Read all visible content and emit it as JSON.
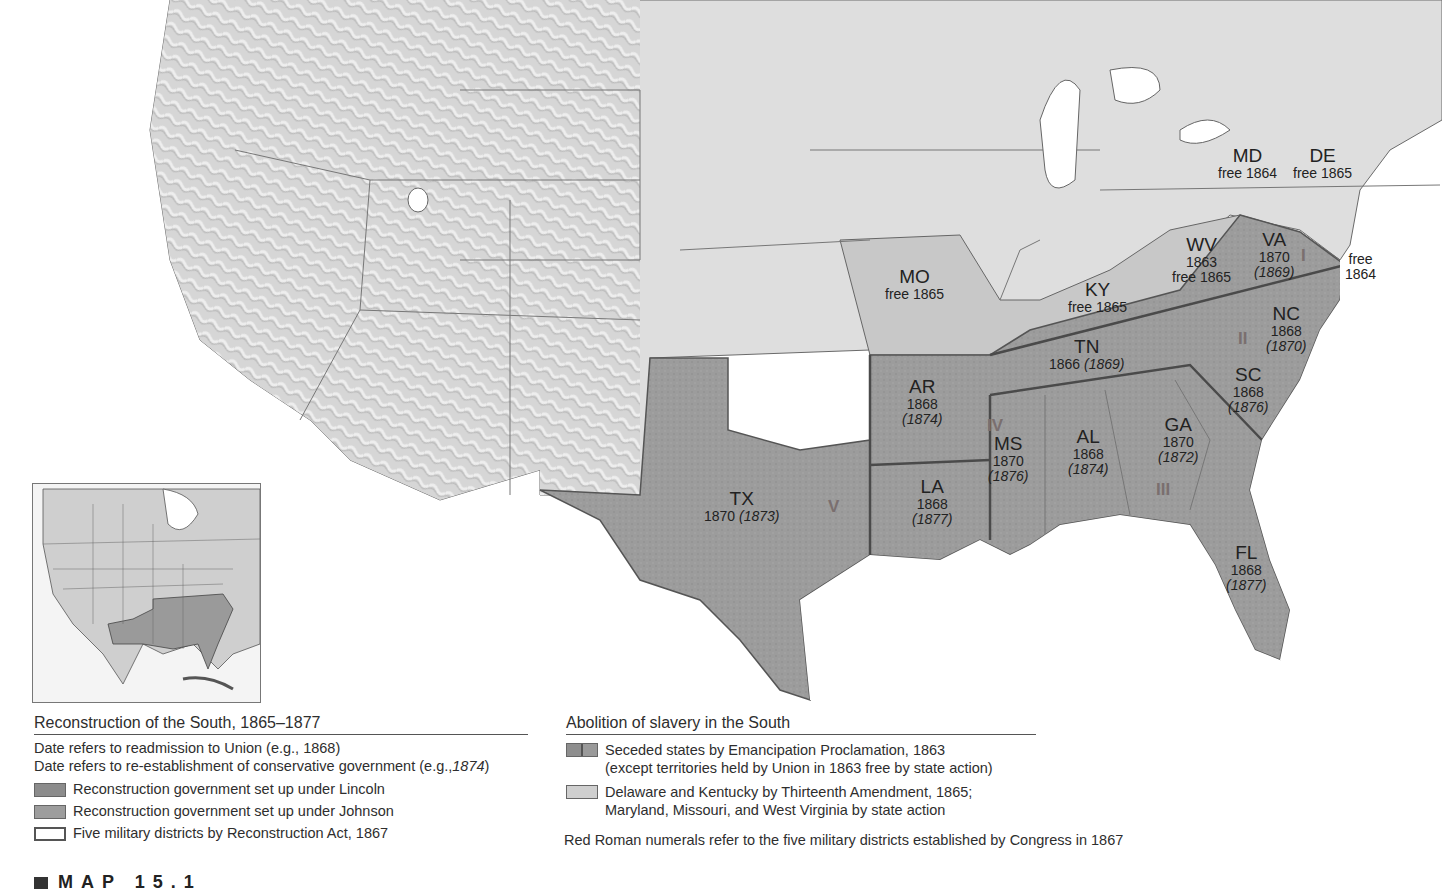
{
  "map": {
    "colors": {
      "union": "#dcdcdc",
      "west_relief": "#d4d4d4",
      "confederate": "#9a9a9a",
      "border_states": "#c6c6c6",
      "water": "#ffffff",
      "roman_numerals": "#7a6f6f"
    },
    "states": [
      {
        "abbr": "MD",
        "line1": "free 1864",
        "line2": ""
      },
      {
        "abbr": "DE",
        "line1": "free 1865",
        "line2": ""
      },
      {
        "abbr": "WV",
        "line1": "1863",
        "line2": "free 1865"
      },
      {
        "abbr": "VA",
        "line1": "1870",
        "line2": "(1869)"
      },
      {
        "abbr": "",
        "line1": "free",
        "line2": "1864"
      },
      {
        "abbr": "MO",
        "line1": "free 1865",
        "line2": ""
      },
      {
        "abbr": "KY",
        "line1": "free 1865",
        "line2": ""
      },
      {
        "abbr": "NC",
        "line1": "1868",
        "line2": "(1870)"
      },
      {
        "abbr": "TN",
        "line1": "1866",
        "line2": "(1869)"
      },
      {
        "abbr": "SC",
        "line1": "1868",
        "line2": "(1876)"
      },
      {
        "abbr": "AR",
        "line1": "1868",
        "line2": "(1874)"
      },
      {
        "abbr": "MS",
        "line1": "1870",
        "line2": "(1876)"
      },
      {
        "abbr": "AL",
        "line1": "1868",
        "line2": "(1874)"
      },
      {
        "abbr": "GA",
        "line1": "1870",
        "line2": "(1872)"
      },
      {
        "abbr": "LA",
        "line1": "1868",
        "line2": "(1877)"
      },
      {
        "abbr": "TX",
        "line1": "1870",
        "line2": "(1873)"
      },
      {
        "abbr": "FL",
        "line1": "1868",
        "line2": "(1877)"
      }
    ],
    "military_districts": [
      "I",
      "II",
      "III",
      "IV",
      "V"
    ]
  },
  "legend_reconstruction": {
    "title": "Reconstruction of the South, 1865–1877",
    "note1": "Date refers to readmission to Union (e.g., 1868)",
    "note2_prefix": "Date refers to re-establishment of conservative government (e.g.,",
    "note2_italic": "1874",
    "note2_suffix": ")",
    "items": [
      {
        "label": "Reconstruction government set up under Lincoln"
      },
      {
        "label": "Reconstruction government set up under Johnson"
      },
      {
        "label": "Five military districts by Reconstruction Act, 1867"
      }
    ]
  },
  "legend_abolition": {
    "title": "Abolition of slavery in the South",
    "items": [
      {
        "line1": "Seceded states by Emancipation Proclamation, 1863",
        "line2": "(except territories held by Union in 1863 free by state action)"
      },
      {
        "line1": "Delaware and Kentucky by Thirteenth Amendment, 1865;",
        "line2": "Maryland, Missouri, and West Virginia by state action"
      }
    ],
    "footnote": "Red Roman numerals refer to the five military districts established by Congress in 1867"
  },
  "caption": "MAP 15.1"
}
